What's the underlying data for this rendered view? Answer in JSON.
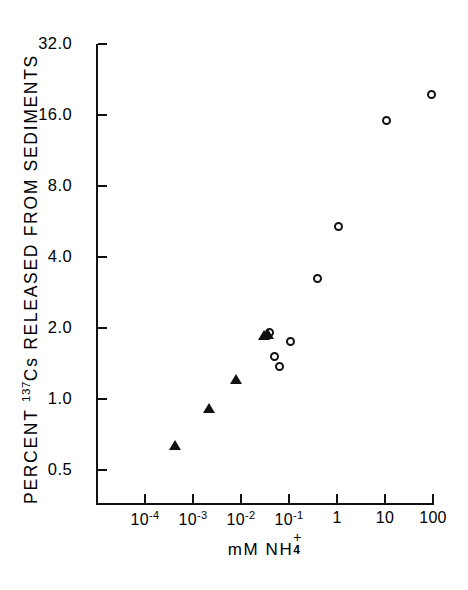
{
  "chart_data": {
    "type": "scatter",
    "title": "",
    "xlabel": "mM NH4+",
    "ylabel": "PERCENT 137Cs RELEASED FROM SEDIMENTS",
    "xscale": "log",
    "yscale": "log",
    "xlim": [
      6e-05,
      180
    ],
    "ylim": [
      0.38,
      32
    ],
    "grid": false,
    "legend": "none",
    "xticks": [
      {
        "value": 0.0001,
        "label": "10",
        "exponent": "-4"
      },
      {
        "value": 0.001,
        "label": "10",
        "exponent": "-3"
      },
      {
        "value": 0.01,
        "label": "10",
        "exponent": "-2"
      },
      {
        "value": 0.1,
        "label": "10",
        "exponent": "-1"
      },
      {
        "value": 1,
        "label": "1",
        "exponent": ""
      },
      {
        "value": 10,
        "label": "10",
        "exponent": ""
      },
      {
        "value": 100,
        "label": "100",
        "exponent": ""
      }
    ],
    "yticks": [
      {
        "value": 0.5,
        "label": "0.5"
      },
      {
        "value": 1.0,
        "label": "1.0"
      },
      {
        "value": 2.0,
        "label": "2.0"
      },
      {
        "value": 4.0,
        "label": "4.0"
      },
      {
        "value": 8.0,
        "label": "8.0"
      },
      {
        "value": 16.0,
        "label": "16.0"
      },
      {
        "value": 32.0,
        "label": "32.0"
      }
    ],
    "series": [
      {
        "name": "filled-triangle",
        "marker": "filled-triangle",
        "points": [
          {
            "x": 0.00042,
            "y": 0.64
          },
          {
            "x": 0.0022,
            "y": 0.92
          },
          {
            "x": 0.0078,
            "y": 1.22
          },
          {
            "x": 0.03,
            "y": 1.86
          },
          {
            "x": 0.036,
            "y": 1.88
          }
        ]
      },
      {
        "name": "open-circle",
        "marker": "open-circle",
        "points": [
          {
            "x": 0.04,
            "y": 1.92
          },
          {
            "x": 0.049,
            "y": 1.52
          },
          {
            "x": 0.062,
            "y": 1.38
          },
          {
            "x": 0.105,
            "y": 1.75
          },
          {
            "x": 0.4,
            "y": 3.25
          },
          {
            "x": 1.05,
            "y": 5.4
          },
          {
            "x": 10.5,
            "y": 15.2
          },
          {
            "x": 92.0,
            "y": 19.6
          }
        ]
      }
    ]
  },
  "yaxis": {
    "title_main": "PERCENT",
    "title_sup": "137",
    "title_rest": "Cs RELEASED FROM SEDIMENTS",
    "title_full": "PERCENT 137Cs RELEASED FROM SEDIMENTS"
  },
  "xaxis": {
    "title_prefix": "mM NH",
    "title_plus": "+",
    "title_sub": "4"
  },
  "colors": {
    "ink": "#111111",
    "background": "#ffffff"
  }
}
